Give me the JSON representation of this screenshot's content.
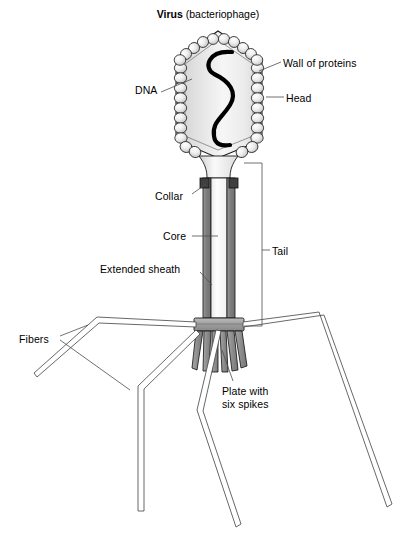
{
  "figure": {
    "title_bold": "Virus",
    "title_rest": " (bacteriophage)",
    "width": 416,
    "height": 534,
    "background": "#ffffff"
  },
  "labels": {
    "wall_of_proteins": "Wall of proteins",
    "head": "Head",
    "dna": "DNA",
    "collar": "Collar",
    "core": "Core",
    "tail": "Tail",
    "extended_sheath": "Extended sheath",
    "fibers": "Fibers",
    "plate_line1": "Plate with",
    "plate_line2": "six spikes"
  },
  "colors": {
    "outline": "#1a1a1a",
    "leader_line": "#555555",
    "capsid_fill_light": "#f2f2f2",
    "capsid_fill_mid": "#d8d8d8",
    "capsomere_fill": "#e9e9e9",
    "dna_strand": "#000000",
    "sheath_gray": "#8a8a8a",
    "core_white": "#fbfbfb",
    "plate_gray": "#9a9a9a",
    "spike_gray": "#8f8f8f",
    "collar_dark": "#4a4a4a",
    "fiber_fill": "#ffffff"
  },
  "structure": {
    "parts": [
      "head-capsid",
      "dna-strand",
      "collar",
      "core",
      "extended-sheath",
      "baseplate",
      "spikes",
      "tail-fibers"
    ],
    "spike_count": 6,
    "fiber_count": 4
  }
}
